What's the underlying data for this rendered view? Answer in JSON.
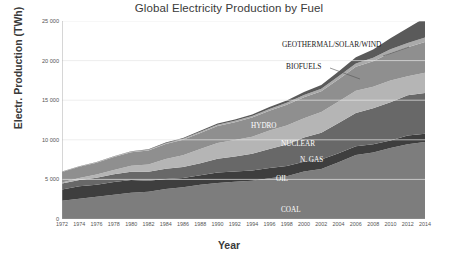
{
  "chart_data": {
    "type": "area",
    "stacked": true,
    "title": "Global Electricity Production by Fuel",
    "xlabel": "Year",
    "ylabel": "Electr. Production (TWh)",
    "xlim": [
      1972,
      2014
    ],
    "ylim": [
      0,
      25000
    ],
    "yticks": [
      "0",
      "5 000",
      "10 000",
      "15 000",
      "20 000",
      "25 000"
    ],
    "ytick_values": [
      0,
      5000,
      10000,
      15000,
      20000,
      25000
    ],
    "xticks": [
      "1972",
      "1974",
      "1976",
      "1978",
      "1980",
      "1982",
      "1984",
      "1986",
      "1988",
      "1990",
      "1992",
      "1994",
      "1996",
      "1998",
      "2000",
      "2002",
      "2004",
      "2006",
      "2008",
      "2010",
      "2012",
      "2014"
    ],
    "grid": "horizontal",
    "legend_position": "inline-labels",
    "x": [
      1972,
      1974,
      1976,
      1978,
      1980,
      1982,
      1984,
      1986,
      1988,
      1990,
      1992,
      1994,
      1996,
      1998,
      2000,
      2002,
      2004,
      2006,
      2008,
      2010,
      2012,
      2014
    ],
    "series": [
      {
        "name": "COAL",
        "color": "#7d7d7d",
        "values": [
          2320,
          2560,
          2810,
          3060,
          3310,
          3440,
          3780,
          4000,
          4320,
          4560,
          4700,
          4840,
          5150,
          5400,
          5990,
          6320,
          7150,
          8070,
          8400,
          8950,
          9430,
          9710
        ]
      },
      {
        "name": "OIL",
        "color": "#3e3e3e",
        "values": [
          1420,
          1560,
          1530,
          1620,
          1610,
          1400,
          1280,
          1180,
          1200,
          1310,
          1290,
          1270,
          1300,
          1290,
          1240,
          1180,
          1160,
          1120,
          1040,
          960,
          1100,
          1050
        ]
      },
      {
        "name": "N. GAS",
        "color": "#686868",
        "values": [
          730,
          800,
          870,
          960,
          1060,
          1140,
          1270,
          1380,
          1520,
          1740,
          1900,
          2120,
          2400,
          2720,
          3050,
          3400,
          3800,
          4200,
          4530,
          4830,
          5100,
          5160
        ]
      },
      {
        "name": "NUCLEAR",
        "color": "#b5b5b5",
        "values": [
          150,
          260,
          410,
          560,
          740,
          900,
          1240,
          1490,
          1800,
          2000,
          2080,
          2170,
          2310,
          2390,
          2450,
          2600,
          2740,
          2790,
          2730,
          2760,
          2400,
          2540
        ]
      },
      {
        "name": "HYDRO",
        "color": "#8f8f8f",
        "values": [
          1310,
          1410,
          1490,
          1620,
          1720,
          1780,
          1900,
          1970,
          2030,
          2140,
          2250,
          2400,
          2520,
          2620,
          2650,
          2640,
          2810,
          3050,
          3210,
          3450,
          3670,
          3890
        ]
      },
      {
        "name": "BIOFUELS",
        "color": "#aaaaaa",
        "values": [
          40,
          45,
          50,
          60,
          70,
          80,
          100,
          120,
          140,
          160,
          180,
          200,
          220,
          250,
          280,
          310,
          350,
          400,
          440,
          480,
          520,
          560
        ]
      },
      {
        "name": "GEOTHERMAL/SOLAR/WIND",
        "color": "#5a5a5a",
        "values": [
          30,
          35,
          40,
          50,
          60,
          70,
          85,
          100,
          120,
          140,
          170,
          200,
          240,
          290,
          360,
          460,
          600,
          800,
          1050,
          1380,
          1900,
          2500
        ]
      }
    ],
    "annotations": [
      {
        "label": "GEOTHERMAL/SOLAR/WIND",
        "style": "outside",
        "x": 282,
        "y": 40,
        "leader": [
          [
            409,
            47
          ],
          [
            383,
            56
          ]
        ]
      },
      {
        "label": "BIOFUELS",
        "style": "outside",
        "x": 286,
        "y": 62,
        "leader": [
          [
            330,
            68
          ],
          [
            360,
            79
          ]
        ]
      },
      {
        "label": "HYDRO",
        "style": "inside",
        "x": 251,
        "y": 122
      },
      {
        "label": "NUCLEAR",
        "style": "inside",
        "x": 281,
        "y": 140
      },
      {
        "label": "N. GAS",
        "style": "inside",
        "x": 300,
        "y": 156
      },
      {
        "label": "OIL",
        "style": "inside",
        "x": 276,
        "y": 175
      },
      {
        "label": "COAL",
        "style": "inside",
        "x": 281,
        "y": 206
      }
    ]
  }
}
